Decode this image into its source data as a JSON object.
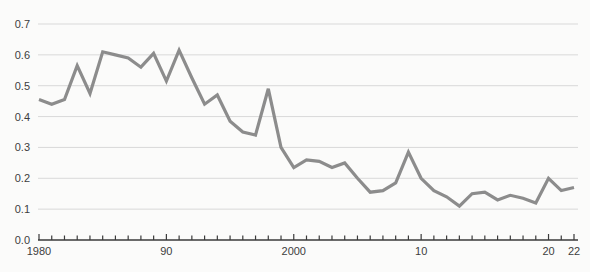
{
  "chart_data": {
    "type": "line",
    "title": "",
    "xlabel": "",
    "ylabel": "",
    "x": [
      1980,
      1981,
      1982,
      1983,
      1984,
      1985,
      1986,
      1987,
      1988,
      1989,
      1990,
      1991,
      1992,
      1993,
      1994,
      1995,
      1996,
      1997,
      1998,
      1999,
      2000,
      2001,
      2002,
      2003,
      2004,
      2005,
      2006,
      2007,
      2008,
      2009,
      2010,
      2011,
      2012,
      2013,
      2014,
      2015,
      2016,
      2017,
      2018,
      2019,
      2020,
      2021,
      2022
    ],
    "values": [
      0.455,
      0.44,
      0.455,
      0.565,
      0.475,
      0.61,
      0.6,
      0.59,
      0.56,
      0.605,
      0.515,
      0.615,
      0.525,
      0.44,
      0.47,
      0.385,
      0.35,
      0.34,
      0.49,
      0.3,
      0.235,
      0.26,
      0.255,
      0.235,
      0.25,
      0.2,
      0.155,
      0.16,
      0.185,
      0.285,
      0.2,
      0.16,
      0.14,
      0.11,
      0.15,
      0.155,
      0.13,
      0.145,
      0.135,
      0.12,
      0.2,
      0.16,
      0.17
    ],
    "xlim": [
      1980,
      2022
    ],
    "ylim": [
      0.0,
      0.7
    ],
    "y_ticks": [
      0.0,
      0.1,
      0.2,
      0.3,
      0.4,
      0.5,
      0.6,
      0.7
    ],
    "y_tick_labels": [
      "0.0",
      "0.1",
      "0.2",
      "0.3",
      "0.4",
      "0.5",
      "0.6",
      "0.7"
    ],
    "x_minor_tick_every": 1,
    "x_tick_labels": [
      {
        "x": 1980,
        "label": "1980"
      },
      {
        "x": 1990,
        "label": "90"
      },
      {
        "x": 2000,
        "label": "2000"
      },
      {
        "x": 2010,
        "label": "10"
      },
      {
        "x": 2020,
        "label": "20"
      },
      {
        "x": 2022,
        "label": "22"
      }
    ],
    "grid": "horizontal",
    "legend": "none",
    "colors": {
      "line": "#8c8c8c",
      "gridline": "#d9d9d9",
      "axis": "#3a3a3a",
      "tick_label": "#3d3d3d",
      "background": "#fbfbfa"
    }
  }
}
